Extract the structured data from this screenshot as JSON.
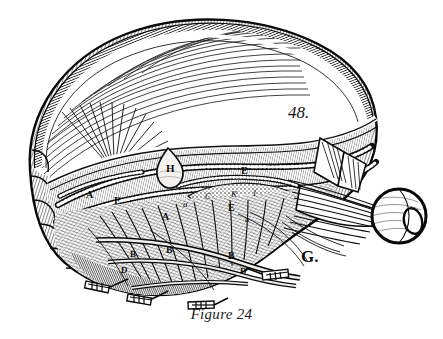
{
  "figure": {
    "caption": "Figure 24",
    "plate_number": "48.",
    "type": "engraving",
    "background_color": "#ffffff",
    "ink_color": "#111111"
  },
  "labels": [
    {
      "id": "label-h",
      "text": "H",
      "style": "roman",
      "x": 166,
      "y": 163,
      "size": 11
    },
    {
      "id": "label-e1",
      "text": "E",
      "style": "roman",
      "x": 241,
      "y": 166,
      "size": 10
    },
    {
      "id": "label-c",
      "text": "C",
      "style": "italic",
      "x": 205,
      "y": 192,
      "size": 9
    },
    {
      "id": "label-k",
      "text": "K",
      "style": "italic",
      "x": 231,
      "y": 190,
      "size": 9
    },
    {
      "id": "label-i",
      "text": "I",
      "style": "italic",
      "x": 253,
      "y": 189,
      "size": 9
    },
    {
      "id": "label-e2",
      "text": "E",
      "style": "roman",
      "x": 228,
      "y": 203,
      "size": 10
    },
    {
      "id": "label-a1",
      "text": "a",
      "style": "italic",
      "x": 183,
      "y": 200,
      "size": 9
    },
    {
      "id": "label-a2",
      "text": "a",
      "style": "italic",
      "x": 245,
      "y": 215,
      "size": 9
    },
    {
      "id": "label-a3",
      "text": "A",
      "style": "roman",
      "x": 162,
      "y": 212,
      "size": 10
    },
    {
      "id": "label-a4",
      "text": "A",
      "style": "roman",
      "x": 86,
      "y": 190,
      "size": 10
    },
    {
      "id": "label-f",
      "text": "F",
      "style": "roman",
      "x": 114,
      "y": 196,
      "size": 10
    },
    {
      "id": "label-b1",
      "text": "B",
      "style": "roman",
      "x": 166,
      "y": 245,
      "size": 10
    },
    {
      "id": "label-b2",
      "text": "B",
      "style": "roman",
      "x": 130,
      "y": 250,
      "size": 9
    },
    {
      "id": "label-b3",
      "text": "B",
      "style": "roman",
      "x": 228,
      "y": 251,
      "size": 10
    },
    {
      "id": "label-d1",
      "text": "D",
      "style": "roman",
      "x": 121,
      "y": 266,
      "size": 9
    },
    {
      "id": "label-d2",
      "text": "D",
      "style": "roman",
      "x": 240,
      "y": 267,
      "size": 9
    },
    {
      "id": "label-g",
      "text": "G.",
      "style": "roman",
      "x": 301,
      "y": 248,
      "size": 17
    }
  ]
}
